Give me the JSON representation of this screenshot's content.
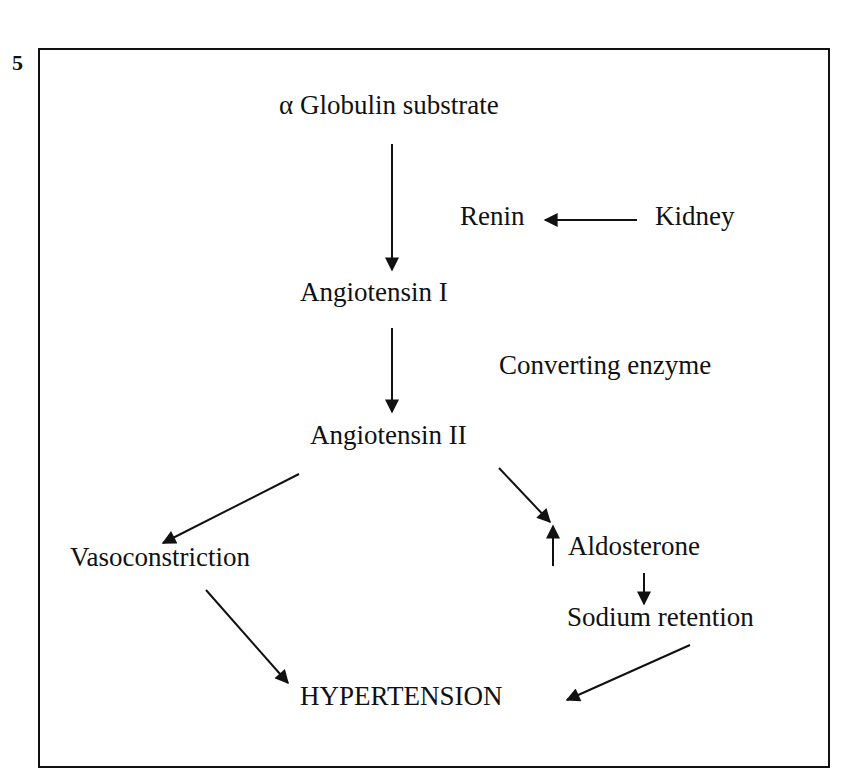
{
  "figure": {
    "number": "5"
  },
  "nodes": {
    "substrate": "α Globulin substrate",
    "renin": "Renin",
    "kidney": "Kidney",
    "angiotensin_1": "Angiotensin I",
    "converting_enzyme": "Converting enzyme",
    "angiotensin_2": "Angiotensin II",
    "vasoconstriction": "Vasoconstriction",
    "aldosterone": "Aldosterone",
    "sodium_retention": "Sodium retention",
    "hypertension": "HYPERTENSION"
  },
  "edges": [
    {
      "from": "substrate",
      "to": "angiotensin_1"
    },
    {
      "from": "kidney",
      "to": "renin"
    },
    {
      "from": "angiotensin_1",
      "to": "angiotensin_2"
    },
    {
      "from": "angiotensin_2",
      "to": "vasoconstriction"
    },
    {
      "from": "angiotensin_2",
      "to": "aldosterone"
    },
    {
      "from": "aldosterone",
      "to": "sodium_retention"
    },
    {
      "from": "vasoconstriction",
      "to": "hypertension"
    },
    {
      "from": "sodium_retention",
      "to": "hypertension"
    }
  ],
  "markers": {
    "aldosterone_increase": "↑"
  }
}
